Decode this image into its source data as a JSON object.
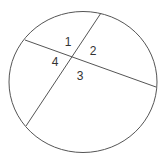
{
  "diagram": {
    "type": "circle-with-two-intersecting-chords",
    "stroke_color": "#555555",
    "circle": {
      "cx": 83,
      "cy": 82,
      "rx": 74,
      "ry": 70.5
    },
    "chords": [
      {
        "x1": 25,
        "y1": 40,
        "x2": 156,
        "y2": 87
      },
      {
        "x1": 101,
        "y1": 13,
        "x2": 26,
        "y2": 126
      }
    ],
    "angle_labels": [
      {
        "text": "1",
        "x": 68,
        "y": 46
      },
      {
        "text": "2",
        "x": 93,
        "y": 55
      },
      {
        "text": "3",
        "x": 80,
        "y": 80
      },
      {
        "text": "4",
        "x": 55,
        "y": 66
      }
    ]
  }
}
